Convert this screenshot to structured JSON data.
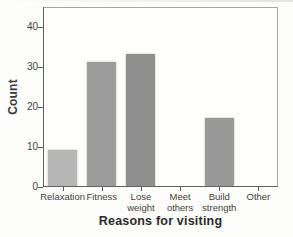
{
  "figure": {
    "background": "#fdfdfb",
    "plot_background": "#fefefc",
    "border_color": "#a6a6a6",
    "axis_color": "#606060",
    "tick_color": "#5a5a5a",
    "text_color": "#3f3f3f",
    "axis_title_color": "#2b2b2b"
  },
  "chart_data": {
    "type": "bar",
    "title": "",
    "xlabel": "Reasons for visiting",
    "ylabel": "Count",
    "categories": [
      "Relaxation",
      "Fitness",
      "Lose weight",
      "Meet others",
      "Build strength",
      "Other"
    ],
    "tick_labels": [
      "Relaxation",
      "Fitness",
      "Lose\nweight",
      "Meet\nothers",
      "Build\nstrength",
      "Other"
    ],
    "values": [
      9,
      31,
      33,
      0,
      17,
      0
    ],
    "bar_colors": [
      "#b6b6b6",
      "#9b9b9b",
      "#8f8f8f",
      "#9a9a9a",
      "#999999",
      "#9a9a9a"
    ],
    "y_ticks": [
      0,
      10,
      20,
      30,
      40
    ],
    "ylim": [
      0,
      45
    ],
    "grid": false,
    "legend": null
  }
}
